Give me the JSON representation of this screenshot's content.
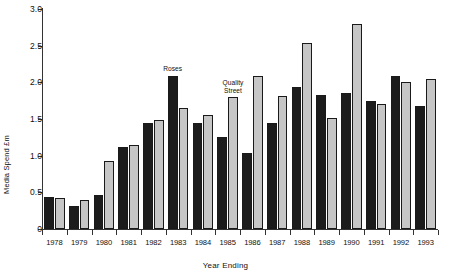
{
  "chart_data": {
    "type": "bar",
    "title": "",
    "xlabel": "Year Ending",
    "ylabel": "Media Spend £m",
    "ylim": [
      0,
      3.0
    ],
    "yticks": [
      "0",
      "0.5",
      "1.0",
      "1.5",
      "2.0",
      "2.5",
      "3.0"
    ],
    "ytick_values": [
      0,
      0.5,
      1.0,
      1.5,
      2.0,
      2.5,
      3.0
    ],
    "grid": false,
    "legend_position": "none",
    "categories": [
      "1978",
      "1979",
      "1980",
      "1981",
      "1982",
      "1983",
      "1984",
      "1985",
      "1986",
      "1987",
      "1988",
      "1989",
      "1990",
      "1991",
      "1992",
      "1993"
    ],
    "series": [
      {
        "name": "dark",
        "color": "#1c1c1c",
        "values": [
          0.43,
          0.32,
          0.46,
          1.12,
          1.45,
          2.09,
          1.44,
          1.26,
          1.04,
          1.44,
          1.94,
          1.83,
          1.85,
          1.74,
          2.09,
          1.68
        ]
      },
      {
        "name": "light",
        "color": "#c6c6c6",
        "values": [
          0.42,
          0.39,
          0.93,
          1.15,
          1.48,
          1.65,
          1.56,
          1.8,
          2.08,
          1.81,
          2.53,
          1.52,
          2.8,
          1.7,
          2.01,
          2.04
        ]
      }
    ],
    "annotations": [
      {
        "text": "Roses",
        "category": "1983",
        "series": "dark",
        "value": 2.09
      },
      {
        "text": "Quality\nStreet",
        "category": "1985",
        "series": "light",
        "value": 1.8
      }
    ]
  }
}
